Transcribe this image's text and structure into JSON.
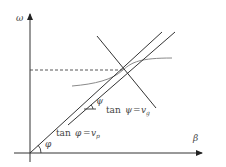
{
  "diagram": {
    "axes": {
      "y_label": "ω",
      "x_label": "β"
    },
    "labels": {
      "phase_angle": "φ",
      "phase_relation_prefix": "tan",
      "phase_relation_var": "φ",
      "phase_relation_eq": "=",
      "phase_relation_rhs": "v",
      "phase_relation_sub": "p",
      "group_angle": "ψ",
      "group_relation_prefix": "tan",
      "group_relation_var": "ψ",
      "group_relation_eq": "=",
      "group_relation_rhs": "v",
      "group_relation_sub": "g"
    },
    "colors": {
      "axis": "#333333",
      "line": "#333333",
      "curve": "#888888",
      "dashed": "#444444",
      "text": "#444444"
    }
  }
}
